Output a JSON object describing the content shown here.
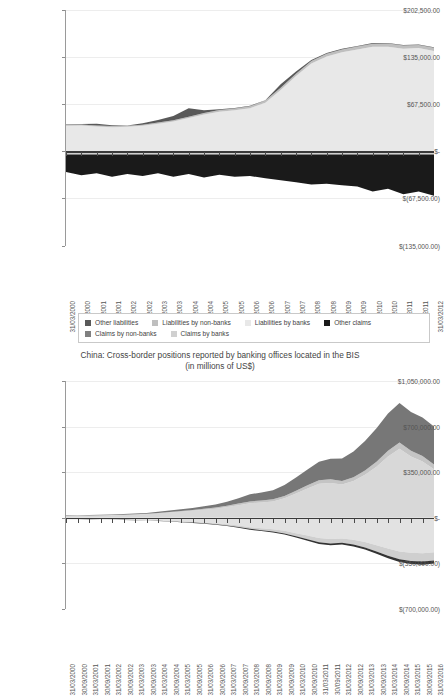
{
  "page": {
    "background": "#ffffff",
    "width": 440,
    "height": 676
  },
  "palette": {
    "other_liabilities": "#595959",
    "liabilities_by_non_banks": "#bfbfbf",
    "liabilities_by_banks": "#e8e8e8",
    "other_claims": "#1a1a1a",
    "claims_by_non_banks": "#808080",
    "claims_by_banks": "#d0d0d0",
    "grid": "#ededed",
    "axis": "#3a3a3a",
    "text": "#444444"
  },
  "legend": {
    "rows": [
      [
        {
          "label": "Other liabilities",
          "color": "#595959"
        },
        {
          "label": "Liabilities by non-banks",
          "color": "#bfbfbf"
        },
        {
          "label": "Liabilities by banks",
          "color": "#e8e8e8"
        },
        {
          "label": "Other claims",
          "color": "#1a1a1a"
        }
      ],
      [
        {
          "label": "Claims by non-banks",
          "color": "#808080"
        },
        {
          "label": "Claims by banks",
          "color": "#d0d0d0"
        }
      ]
    ]
  },
  "chart_data": [
    {
      "id": "chart-top",
      "type": "area",
      "stacked": true,
      "title": "",
      "subtitle": "(in millions of US$)",
      "title_truncated": true,
      "xlabel": "",
      "ylabel": "",
      "ylim": [
        -135000,
        202500
      ],
      "ytick_labels": [
        "$202,500.00",
        "$135,000.00",
        "$67,500.00",
        "$-",
        "$(67,500.00)",
        "$(135,000.00)"
      ],
      "ytick_values": [
        202500,
        135000,
        67500,
        0,
        -67500,
        -135000
      ],
      "grid": true,
      "legend_position": "bottom",
      "categories": [
        "31/03/2000",
        "30/09/2000",
        "31/03/2001",
        "30/09/2001",
        "31/03/2002",
        "30/09/2002",
        "31/03/2003",
        "30/09/2003",
        "31/03/2004",
        "30/09/2004",
        "31/03/2005",
        "30/09/2005",
        "31/03/2006",
        "30/09/2006",
        "31/03/2007",
        "30/09/2007",
        "31/03/2008",
        "30/09/2008",
        "31/03/2009",
        "30/09/2009",
        "31/03/2010",
        "30/09/2010",
        "31/03/2011",
        "30/09/2011",
        "31/03/2012"
      ],
      "series": [
        {
          "name": "Liabilities by banks",
          "color": "#e8e8e8",
          "side": "positive",
          "values": [
            37000,
            37500,
            36000,
            35000,
            35500,
            37000,
            40000,
            43000,
            48000,
            53000,
            57000,
            59000,
            62000,
            70000,
            88000,
            108000,
            126000,
            136000,
            142000,
            146000,
            150000,
            150000,
            147000,
            148000,
            144000
          ]
        },
        {
          "name": "Liabilities by non-banks",
          "color": "#bfbfbf",
          "side": "positive",
          "values": [
            1200,
            1300,
            1400,
            1500,
            1400,
            1500,
            1600,
            1800,
            2000,
            2200,
            2400,
            2600,
            2800,
            3000,
            3200,
            3400,
            3600,
            3800,
            4000,
            4200,
            4400,
            4500,
            4600,
            4600,
            4500
          ]
        },
        {
          "name": "Other liabilities",
          "color": "#595959",
          "side": "positive",
          "values": [
            400,
            500,
            2500,
            1200,
            600,
            2000,
            3500,
            6000,
            12000,
            4000,
            1200,
            800,
            600,
            600,
            5000,
            3000,
            1500,
            1200,
            1000,
            900,
            800,
            800,
            700,
            700,
            700
          ]
        },
        {
          "name": "Claims by banks",
          "color": "#d0d0d0",
          "side": "negative",
          "values": [
            -3500,
            -3500,
            -3500,
            -3500,
            -3500,
            -3500,
            -3500,
            -3500,
            -3500,
            -3500,
            -3500,
            -3500,
            -3500,
            -3500,
            -3500,
            -3500,
            -3500,
            -3500,
            -3500,
            -3500,
            -3500,
            -3500,
            -3500,
            -3500,
            -3500
          ]
        },
        {
          "name": "Claims by non-banks",
          "color": "#808080",
          "side": "negative",
          "values": [
            -1500,
            -1500,
            -1500,
            -1500,
            -1500,
            -1500,
            -1500,
            -1500,
            -1500,
            -1500,
            -1500,
            -1500,
            -1500,
            -1500,
            -1500,
            -1500,
            -1500,
            -1500,
            -1500,
            -1500,
            -1500,
            -1500,
            -1500,
            -1500,
            -1500
          ]
        },
        {
          "name": "Other claims",
          "color": "#1a1a1a",
          "side": "negative",
          "values": [
            -24000,
            -29000,
            -26000,
            -31000,
            -27000,
            -30000,
            -26000,
            -31000,
            -27000,
            -32000,
            -28000,
            -31000,
            -30000,
            -33000,
            -36000,
            -39000,
            -42000,
            -41000,
            -43000,
            -45000,
            -52000,
            -48000,
            -56000,
            -52000,
            -58000
          ]
        }
      ]
    },
    {
      "id": "chart-bottom",
      "type": "area",
      "stacked": true,
      "title": "China: Cross-border positions reported by banking offices located in the BIS",
      "subtitle": "(in millions of US$)",
      "title_truncated": false,
      "xlabel": "",
      "ylabel": "",
      "ylim": [
        -700000,
        1050000
      ],
      "ytick_labels": [
        "$1,050,000.00",
        "$700,000.00",
        "$350,000.00",
        "$-",
        "$(350,000.00)",
        "$(700,000.00)"
      ],
      "ytick_values": [
        1050000,
        700000,
        350000,
        0,
        -350000,
        -700000
      ],
      "grid": true,
      "legend_position": "none",
      "categories": [
        "31/03/2000",
        "30/09/2000",
        "31/03/2001",
        "30/09/2001",
        "31/03/2002",
        "30/09/2002",
        "31/03/2003",
        "30/09/2003",
        "31/03/2004",
        "30/09/2004",
        "31/03/2005",
        "30/09/2005",
        "31/03/2006",
        "30/09/2006",
        "31/03/2007",
        "30/09/2007",
        "31/03/2008",
        "30/09/2008",
        "31/03/2009",
        "30/09/2009",
        "31/03/2010",
        "30/09/2010",
        "31/03/2011",
        "30/09/2011",
        "31/03/2012",
        "30/09/2012",
        "31/03/2013",
        "30/09/2013",
        "31/03/2014",
        "30/09/2014",
        "31/03/2015",
        "30/09/2015",
        "31/03/2016"
      ],
      "series": [
        {
          "name": "Liabilities by banks",
          "color": "#d8d8d8",
          "side": "positive",
          "values": [
            14000,
            15000,
            16000,
            17000,
            19000,
            21000,
            24000,
            27000,
            33000,
            40000,
            47000,
            54000,
            62000,
            70000,
            82000,
            97000,
            112000,
            118000,
            126000,
            150000,
            186000,
            225000,
            262000,
            268000,
            256000,
            283000,
            330000,
            392000,
            470000,
            530000,
            470000,
            432000,
            372000
          ]
        },
        {
          "name": "Liabilities by non-banks",
          "color": "#c4c4c4",
          "side": "positive",
          "values": [
            2000,
            2200,
            2400,
            2600,
            2900,
            3200,
            3600,
            4000,
            4600,
            5200,
            6000,
            6800,
            7600,
            8600,
            10000,
            12000,
            14000,
            15000,
            16000,
            18000,
            21000,
            24000,
            27000,
            28000,
            27000,
            29000,
            33000,
            38000,
            44000,
            48000,
            45000,
            42000,
            38000
          ]
        },
        {
          "name": "Other liabilities",
          "color": "#777777",
          "side": "positive",
          "values": [
            3000,
            3200,
            3500,
            3800,
            4200,
            4800,
            5500,
            6500,
            8000,
            10000,
            12000,
            15000,
            19000,
            24000,
            32000,
            42000,
            54000,
            62000,
            70000,
            84000,
            102000,
            122000,
            142000,
            158000,
            172000,
            196000,
            226000,
            258000,
            286000,
            304000,
            298000,
            296000,
            290000
          ]
        },
        {
          "name": "Claims by banks",
          "color": "#e2e2e2",
          "side": "negative",
          "values": [
            -9000,
            -9500,
            -10000,
            -11000,
            -12000,
            -13000,
            -15000,
            -17000,
            -20000,
            -23000,
            -27000,
            -31000,
            -36000,
            -42000,
            -50000,
            -60000,
            -72000,
            -80000,
            -88000,
            -100000,
            -118000,
            -136000,
            -155000,
            -162000,
            -158000,
            -168000,
            -186000,
            -210000,
            -236000,
            -258000,
            -268000,
            -272000,
            -265000
          ]
        },
        {
          "name": "Claims by non-banks",
          "color": "#cfcfcf",
          "side": "negative",
          "values": [
            -1500,
            -1600,
            -1700,
            -1900,
            -2100,
            -2300,
            -2600,
            -3000,
            -3500,
            -4100,
            -4800,
            -5600,
            -6500,
            -7600,
            -9000,
            -11000,
            -13000,
            -15000,
            -17000,
            -20000,
            -24000,
            -28000,
            -33000,
            -35000,
            -34000,
            -37000,
            -42000,
            -48000,
            -55000,
            -60000,
            -63000,
            -64000,
            -62000
          ]
        },
        {
          "name": "Other claims",
          "color": "#333333",
          "side": "negative",
          "values": [
            -600,
            -700,
            -800,
            -900,
            -1000,
            -1100,
            -1300,
            -1500,
            -1700,
            -2000,
            -2300,
            -2700,
            -3100,
            -3600,
            -4200,
            -5000,
            -6000,
            -6800,
            -7600,
            -8600,
            -10000,
            -11500,
            -13000,
            -14000,
            -13500,
            -14500,
            -16000,
            -18000,
            -20000,
            -22000,
            -23000,
            -23500,
            -23000
          ]
        }
      ]
    }
  ]
}
